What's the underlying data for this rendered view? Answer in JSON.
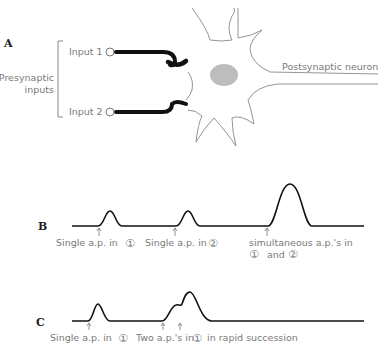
{
  "panels": {
    "a": {
      "label": "A",
      "bracket_label_line1": "Presynaptic",
      "bracket_label_line2": "inputs",
      "input1": "Input 1",
      "input2": "Input 2",
      "neuron_label": "Postsynaptic neuron"
    },
    "b": {
      "label": "B",
      "caption1": "Single a.p. in",
      "caption1_num": "①",
      "caption2": "Single a.p. in",
      "caption2_num": "②",
      "caption3_line1": "simultaneous a.p.'s in",
      "caption3_num1": "①",
      "caption3_and": "and",
      "caption3_num2": "②"
    },
    "c": {
      "label": "C",
      "caption1": "Single a.p. in",
      "caption1_num": "①",
      "caption2": "Two a.p.'s in",
      "caption2_num": "①",
      "caption2_tail": "in rapid succession"
    }
  },
  "colors": {
    "trace": "#111111",
    "label": "#7a7a7a",
    "nucleus": "#bdbdbd",
    "membrane": "#888888"
  }
}
